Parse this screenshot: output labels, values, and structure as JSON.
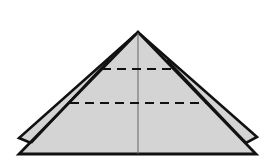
{
  "diagram": {
    "type": "origami-fold-diagram",
    "colors": {
      "background": "#ffffff",
      "paper_fill": "#d4d4d4",
      "outline": "#111111",
      "crease": "#555555",
      "fold_line": "#111111"
    },
    "apex": [
      138,
      32
    ],
    "front_triangle": {
      "left": [
        19,
        154
      ],
      "right": [
        256,
        154
      ]
    },
    "back_flaps": {
      "left": {
        "outer": [
          19,
          138
        ],
        "notch": [
          31,
          143
        ]
      },
      "right": {
        "outer": [
          257,
          137
        ],
        "notch": [
          246,
          143
        ]
      }
    },
    "center_crease": {
      "x": 138,
      "y1": 33,
      "y2": 154
    },
    "fold_lines": [
      {
        "name": "upper-valley-fold",
        "y": 69,
        "x1": 102,
        "x2": 174,
        "style": "dashed"
      },
      {
        "name": "lower-valley-fold",
        "y": 103,
        "x1": 70,
        "x2": 206,
        "style": "dashed"
      }
    ]
  }
}
